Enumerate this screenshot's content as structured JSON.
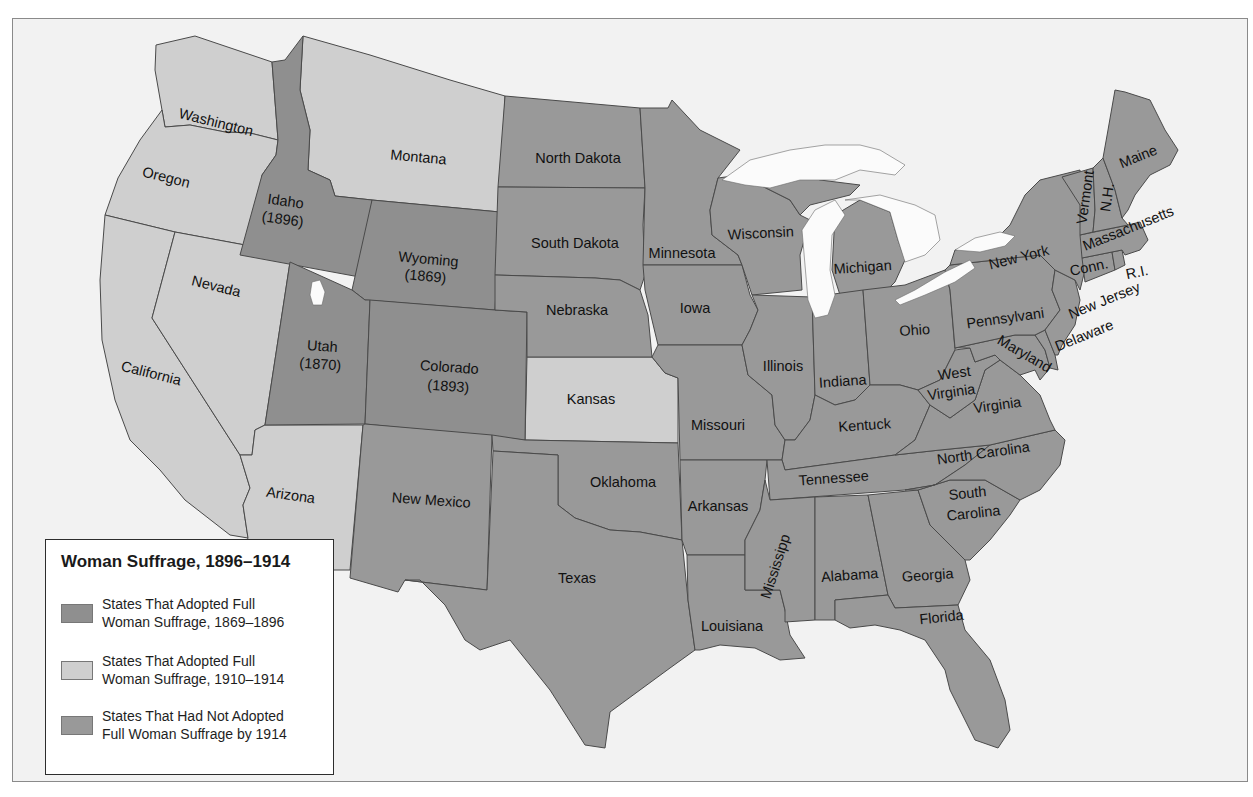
{
  "colors": {
    "adopted_1869_1896": "#8f8f8f",
    "adopted_1910_1914": "#cfcfcf",
    "not_adopted": "#999999",
    "water": "#fbfbfb",
    "background": "#f2f2f2"
  },
  "legend": {
    "title": "Woman Suffrage, 1896–1914",
    "items": [
      {
        "label": "States That Adopted Full\nWoman Suffrage, 1869–1896",
        "category": "adopted_1869_1896"
      },
      {
        "label": "States That Adopted Full\nWoman Suffrage, 1910–1914",
        "category": "adopted_1910_1914"
      },
      {
        "label": "States That Had Not Adopted\nFull Woman Suffrage by 1914",
        "category": "not_adopted"
      }
    ]
  },
  "states": {
    "washington": {
      "name": "Washington",
      "category": "adopted_1910_1914"
    },
    "oregon": {
      "name": "Oregon",
      "category": "adopted_1910_1914"
    },
    "california": {
      "name": "California",
      "category": "adopted_1910_1914"
    },
    "nevada": {
      "name": "Nevada",
      "category": "adopted_1910_1914"
    },
    "arizona": {
      "name": "Arizona",
      "category": "adopted_1910_1914"
    },
    "montana": {
      "name": "Montana",
      "category": "adopted_1910_1914"
    },
    "kansas": {
      "name": "Kansas",
      "category": "adopted_1910_1914"
    },
    "idaho": {
      "name": "Idaho",
      "year": "(1896)",
      "category": "adopted_1869_1896"
    },
    "wyoming": {
      "name": "Wyoming",
      "year": "(1869)",
      "category": "adopted_1869_1896"
    },
    "utah": {
      "name": "Utah",
      "year": "(1870)",
      "category": "adopted_1869_1896"
    },
    "colorado": {
      "name": "Colorado",
      "year": "(1893)",
      "category": "adopted_1869_1896"
    },
    "new_mexico": {
      "name": "New Mexico",
      "category": "not_adopted"
    },
    "north_dakota": {
      "name": "North Dakota",
      "category": "not_adopted"
    },
    "south_dakota": {
      "name": "South Dakota",
      "category": "not_adopted"
    },
    "nebraska": {
      "name": "Nebraska",
      "category": "not_adopted"
    },
    "oklahoma": {
      "name": "Oklahoma",
      "category": "not_adopted"
    },
    "texas": {
      "name": "Texas",
      "category": "not_adopted"
    },
    "minnesota": {
      "name": "Minnesota",
      "category": "not_adopted"
    },
    "iowa": {
      "name": "Iowa",
      "category": "not_adopted"
    },
    "missouri": {
      "name": "Missouri",
      "category": "not_adopted"
    },
    "arkansas": {
      "name": "Arkansas",
      "category": "not_adopted"
    },
    "louisiana": {
      "name": "Louisiana",
      "category": "not_adopted"
    },
    "wisconsin": {
      "name": "Wisconsin",
      "category": "not_adopted"
    },
    "michigan": {
      "name": "Michigan",
      "category": "not_adopted"
    },
    "illinois": {
      "name": "Illinois",
      "category": "not_adopted"
    },
    "indiana": {
      "name": "Indiana",
      "category": "not_adopted"
    },
    "ohio": {
      "name": "Ohio",
      "category": "not_adopted"
    },
    "kentucky": {
      "name": "Kentuck",
      "category": "not_adopted"
    },
    "tennessee": {
      "name": "Tennessee",
      "category": "not_adopted"
    },
    "mississippi": {
      "name": "Mississipp",
      "category": "not_adopted"
    },
    "alabama": {
      "name": "Alabama",
      "category": "not_adopted"
    },
    "georgia": {
      "name": "Georgia",
      "category": "not_adopted"
    },
    "florida": {
      "name": "Florida",
      "category": "not_adopted"
    },
    "south_carolina": {
      "name": "South",
      "name2": "Carolina",
      "category": "not_adopted"
    },
    "north_carolina": {
      "name": "North Carolina",
      "category": "not_adopted"
    },
    "virginia": {
      "name": "Virginia",
      "category": "not_adopted"
    },
    "west_virginia": {
      "name": "West",
      "name2": "Virginia",
      "category": "not_adopted"
    },
    "maryland": {
      "name": "Maryland",
      "category": "not_adopted"
    },
    "delaware": {
      "name": "Delaware",
      "category": "not_adopted"
    },
    "pennsylvania": {
      "name": "Pennsylvani",
      "category": "not_adopted"
    },
    "new_jersey": {
      "name": "New Jersey",
      "category": "not_adopted"
    },
    "new_york": {
      "name": "New York",
      "category": "not_adopted"
    },
    "connecticut": {
      "name": "Conn.",
      "category": "not_adopted"
    },
    "rhode_island": {
      "name": "R.I.",
      "category": "not_adopted"
    },
    "massachusetts": {
      "name": "Massachusetts",
      "category": "not_adopted"
    },
    "vermont": {
      "name": "Vermont",
      "category": "not_adopted"
    },
    "new_hampshire": {
      "name": "N.H.",
      "category": "not_adopted"
    },
    "maine": {
      "name": "Maine",
      "category": "not_adopted"
    }
  }
}
